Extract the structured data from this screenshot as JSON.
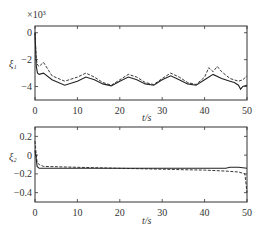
{
  "chart_data": [
    {
      "type": "line",
      "title": "",
      "ylabel": "ξ1",
      "xlabel": "t/s",
      "y_multiplier": "×10³",
      "xlim": [
        0,
        50
      ],
      "ylim": [
        -5,
        0.5
      ],
      "xticks": [
        "0",
        "10",
        "20",
        "30",
        "40",
        "50"
      ],
      "yticks": [
        "0",
        "-2",
        "-4"
      ],
      "grid": false,
      "series": [
        {
          "name": "solid",
          "style": "solid",
          "x": [
            0,
            0.3,
            0.6,
            1,
            2,
            4,
            7,
            10,
            12,
            14,
            16,
            18,
            20,
            22,
            24,
            26,
            28,
            30,
            32,
            34,
            36,
            38,
            40,
            42,
            44,
            46,
            47,
            48,
            48.5,
            49,
            50
          ],
          "y": [
            0,
            -2.5,
            -3.0,
            -3.1,
            -3.0,
            -3.5,
            -3.9,
            -3.6,
            -3.3,
            -3.5,
            -3.8,
            -3.95,
            -3.6,
            -3.3,
            -3.5,
            -3.8,
            -3.9,
            -3.5,
            -3.2,
            -3.5,
            -3.8,
            -3.9,
            -3.5,
            -3.1,
            -3.4,
            -3.6,
            -3.7,
            -3.9,
            -4.2,
            -4.0,
            -3.9
          ]
        },
        {
          "name": "dashed",
          "style": "dashed",
          "x": [
            0,
            0.3,
            0.6,
            1,
            2,
            4,
            7,
            10,
            12,
            14,
            16,
            18,
            20,
            22,
            24,
            26,
            28,
            30,
            32,
            34,
            36,
            38,
            40,
            41,
            42,
            43,
            44,
            46,
            48,
            49,
            50
          ],
          "y": [
            0,
            -2.0,
            -2.4,
            -2.5,
            -2.2,
            -3.2,
            -3.6,
            -3.3,
            -3.0,
            -3.3,
            -3.7,
            -3.9,
            -3.5,
            -3.1,
            -3.3,
            -3.7,
            -3.85,
            -3.4,
            -3.0,
            -3.3,
            -3.7,
            -3.85,
            -3.3,
            -2.6,
            -2.9,
            -2.5,
            -2.9,
            -3.4,
            -3.6,
            -3.5,
            -3.2
          ]
        }
      ]
    },
    {
      "type": "line",
      "title": "",
      "ylabel": "ξ2",
      "xlabel": "t/s",
      "xlim": [
        0,
        50
      ],
      "ylim": [
        -0.5,
        0.3
      ],
      "xticks": [
        "0",
        "10",
        "20",
        "30",
        "40",
        "50"
      ],
      "yticks": [
        "0.2",
        "0",
        "-0.2",
        "-0.4"
      ],
      "grid": false,
      "series": [
        {
          "name": "solid",
          "style": "solid",
          "x": [
            0,
            0.2,
            0.5,
            1,
            2,
            10,
            20,
            30,
            40,
            45,
            46,
            48,
            50
          ],
          "y": [
            0.05,
            0.0,
            -0.12,
            -0.14,
            -0.14,
            -0.14,
            -0.14,
            -0.14,
            -0.14,
            -0.14,
            -0.13,
            -0.13,
            -0.14
          ]
        },
        {
          "name": "dashed",
          "style": "dashed",
          "x": [
            0,
            0.2,
            0.5,
            1,
            2,
            10,
            20,
            30,
            35,
            40,
            45,
            48,
            49.5,
            50
          ],
          "y": [
            0.15,
            0.05,
            -0.08,
            -0.1,
            -0.12,
            -0.13,
            -0.14,
            -0.15,
            -0.155,
            -0.16,
            -0.17,
            -0.18,
            -0.2,
            -0.4
          ]
        }
      ]
    }
  ],
  "labels": {
    "top_multiplier": "×10³",
    "top_ylabel": "ξ₁",
    "bottom_ylabel": "ξ₂",
    "xlabel": "t/s",
    "x_ticks": [
      "0",
      "10",
      "20",
      "30",
      "40",
      "50"
    ],
    "top_y_ticks": [
      "0",
      "−2",
      "−4"
    ],
    "bottom_y_ticks": [
      "0.2",
      "0",
      "−0.2",
      "−0.4"
    ]
  }
}
